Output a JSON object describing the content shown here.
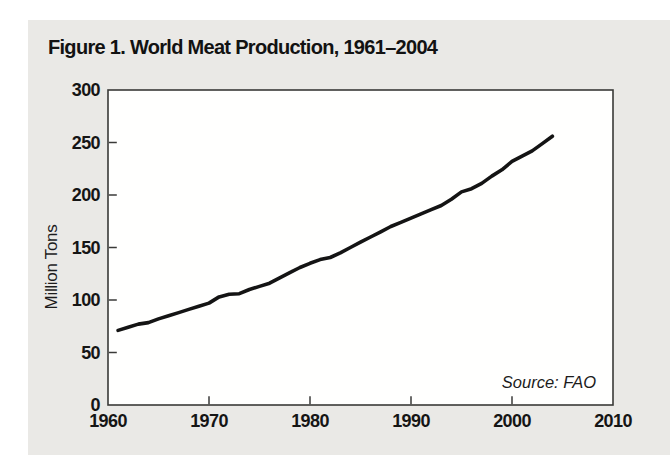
{
  "panel": {
    "background": "#eae9e6",
    "plot_background": "#fffffe",
    "axis_color": "#3a3a38"
  },
  "chart_data": {
    "type": "line",
    "title": "Figure 1. World Meat Production, 1961–2004",
    "ylabel": "Million Tons",
    "xlabel": "",
    "source": "Source: FAO",
    "line_color": "#141414",
    "line_width": 3.6,
    "grid": false,
    "legend": null,
    "xlim": [
      1960,
      2010
    ],
    "ylim": [
      0,
      300
    ],
    "xticks": [
      1960,
      1970,
      1980,
      1990,
      2000,
      2010
    ],
    "yticks": [
      0,
      50,
      100,
      150,
      200,
      250,
      300
    ],
    "x": [
      1961,
      1962,
      1963,
      1964,
      1965,
      1966,
      1967,
      1968,
      1969,
      1970,
      1971,
      1972,
      1973,
      1974,
      1975,
      1976,
      1977,
      1978,
      1979,
      1980,
      1981,
      1982,
      1983,
      1984,
      1985,
      1986,
      1987,
      1988,
      1989,
      1990,
      1991,
      1992,
      1993,
      1994,
      1995,
      1996,
      1997,
      1998,
      1999,
      2000,
      2001,
      2002,
      2003,
      2004
    ],
    "values": [
      71,
      74,
      77,
      78.5,
      82,
      85,
      88,
      91,
      94,
      97,
      103,
      105.5,
      106,
      110,
      113,
      116,
      121,
      126,
      131,
      135,
      138.5,
      140.5,
      145,
      150,
      155,
      160,
      165,
      170,
      174,
      178,
      182,
      186,
      190,
      196,
      203,
      206,
      211,
      218,
      224,
      232,
      237,
      242,
      249,
      256
    ]
  }
}
